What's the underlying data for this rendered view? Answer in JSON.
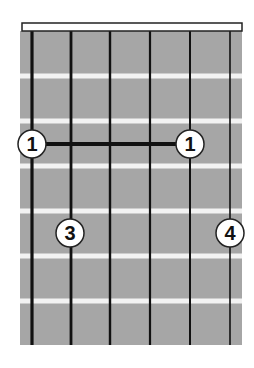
{
  "diagram": {
    "type": "guitar-chord-diagram",
    "colors": {
      "fretboard": "#a6a6a6",
      "fret_line": "#f2f2f2",
      "string": "#111111",
      "nut_fill": "#ffffff",
      "nut_stroke": "#222222",
      "finger_fill": "#ffffff",
      "finger_stroke": "#222222",
      "finger_text": "#111111",
      "barre": "#111111"
    },
    "geometry": {
      "board": {
        "x": 20,
        "y": 31,
        "width": 222,
        "height": 314
      },
      "nut": {
        "x": 22,
        "y": 23,
        "width": 220,
        "height": 8
      },
      "strings_x": [
        32,
        71,
        110,
        150,
        190,
        230
      ],
      "string_widths": [
        3.2,
        2.8,
        2.4,
        2.2,
        2,
        1.6
      ],
      "frets_y": [
        76,
        121,
        166,
        211,
        256,
        301
      ],
      "finger_radius": 14
    },
    "strings": [
      "E",
      "A",
      "D",
      "G",
      "B",
      "e"
    ],
    "barre": {
      "fret": 1,
      "from_string": 1,
      "to_string": 5,
      "y": 144
    },
    "fingers": [
      {
        "string": 1,
        "fret": 1,
        "label": "1",
        "x": 32,
        "y": 144
      },
      {
        "string": 5,
        "fret": 1,
        "label": "1",
        "x": 190,
        "y": 144
      },
      {
        "string": 2,
        "fret": 3,
        "label": "3",
        "x": 70,
        "y": 233
      },
      {
        "string": 6,
        "fret": 3,
        "label": "4",
        "x": 230,
        "y": 233
      }
    ]
  }
}
